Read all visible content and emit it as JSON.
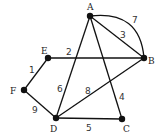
{
  "graph": {
    "nodes": [
      {
        "id": "A",
        "x": 90,
        "y": 16,
        "lx": 87,
        "ly": 10
      },
      {
        "id": "B",
        "x": 144,
        "y": 58,
        "lx": 148,
        "ly": 64
      },
      {
        "id": "C",
        "x": 122,
        "y": 119,
        "lx": 123,
        "ly": 132
      },
      {
        "id": "D",
        "x": 56,
        "y": 118,
        "lx": 50,
        "ly": 132
      },
      {
        "id": "E",
        "x": 48,
        "y": 58,
        "lx": 41,
        "ly": 54
      },
      {
        "id": "F",
        "x": 24,
        "y": 90,
        "lx": 10,
        "ly": 94
      }
    ],
    "edges": [
      {
        "from": "A",
        "to": "B",
        "weight": "3",
        "lx": 120,
        "ly": 38,
        "shape": "line"
      },
      {
        "from": "A",
        "to": "B",
        "weight": "7",
        "lx": 132,
        "ly": 23,
        "shape": "arc"
      },
      {
        "from": "E",
        "to": "B",
        "weight": "2",
        "lx": 66,
        "ly": 55,
        "shape": "line"
      },
      {
        "from": "A",
        "to": "D",
        "weight": "6",
        "lx": 57,
        "ly": 92,
        "shape": "line"
      },
      {
        "from": "A",
        "to": "C",
        "weight": "4",
        "lx": 119,
        "ly": 100,
        "shape": "line"
      },
      {
        "from": "D",
        "to": "B",
        "weight": "8",
        "lx": 85,
        "ly": 94,
        "shape": "line"
      },
      {
        "from": "E",
        "to": "F",
        "weight": "1",
        "lx": 29,
        "ly": 73,
        "shape": "line"
      },
      {
        "from": "F",
        "to": "D",
        "weight": "9",
        "lx": 32,
        "ly": 113,
        "shape": "line"
      },
      {
        "from": "D",
        "to": "C",
        "weight": "5",
        "lx": 86,
        "ly": 131,
        "shape": "line"
      }
    ]
  }
}
